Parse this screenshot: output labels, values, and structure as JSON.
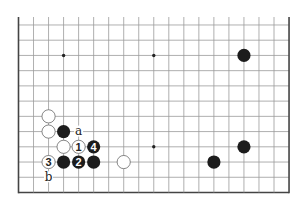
{
  "diagram": {
    "type": "go-board-fragment",
    "board_size": 19,
    "visible_rows": [
      1,
      12
    ],
    "colors": {
      "background": "#ffffff",
      "grid_line": "#9a9a9a",
      "edge_line": "#444444",
      "black_stone": "#1c1c1c",
      "white_stone_fill": "#ffffff",
      "white_stone_stroke": "#555555",
      "star_point": "#222222"
    },
    "star_points": [
      {
        "col": 4,
        "row": 10
      },
      {
        "col": 10,
        "row": 10
      },
      {
        "col": 10,
        "row": 4
      },
      {
        "col": 16,
        "row": 4
      }
    ],
    "stones": [
      {
        "color": "white",
        "col": 3,
        "row": 6,
        "label": ""
      },
      {
        "color": "white",
        "col": 3,
        "row": 5,
        "label": ""
      },
      {
        "color": "black",
        "col": 4,
        "row": 5,
        "label": ""
      },
      {
        "color": "white",
        "col": 4,
        "row": 4,
        "label": ""
      },
      {
        "color": "white",
        "col": 5,
        "row": 4,
        "label": "1"
      },
      {
        "color": "black",
        "col": 6,
        "row": 4,
        "label": "4"
      },
      {
        "color": "white",
        "col": 3,
        "row": 3,
        "label": "3"
      },
      {
        "color": "black",
        "col": 4,
        "row": 3,
        "label": ""
      },
      {
        "color": "black",
        "col": 5,
        "row": 3,
        "label": "2"
      },
      {
        "color": "black",
        "col": 6,
        "row": 3,
        "label": ""
      },
      {
        "color": "white",
        "col": 8,
        "row": 3,
        "label": ""
      },
      {
        "color": "black",
        "col": 14,
        "row": 3,
        "label": ""
      },
      {
        "color": "black",
        "col": 16,
        "row": 4,
        "label": ""
      },
      {
        "color": "black",
        "col": 16,
        "row": 10,
        "label": ""
      }
    ],
    "marks": [
      {
        "col": 5,
        "row": 5,
        "label": "a"
      },
      {
        "col": 3,
        "row": 2,
        "label": "b"
      }
    ]
  }
}
